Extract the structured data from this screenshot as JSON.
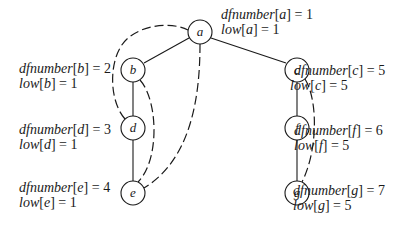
{
  "diagram": {
    "type": "dfs-tree-with-back-edges",
    "nodes": [
      {
        "id": "a",
        "label": "a",
        "x": 200,
        "y": 32,
        "dfnumber": "1",
        "low": "1"
      },
      {
        "id": "b",
        "label": "b",
        "x": 133,
        "y": 70,
        "dfnumber": "2",
        "low": "1"
      },
      {
        "id": "c",
        "label": "c",
        "x": 297,
        "y": 70,
        "dfnumber": "5",
        "low": "5"
      },
      {
        "id": "d",
        "label": "d",
        "x": 133,
        "y": 128,
        "dfnumber": "3",
        "low": "1"
      },
      {
        "id": "e",
        "label": "e",
        "x": 133,
        "y": 193,
        "dfnumber": "4",
        "low": "1"
      },
      {
        "id": "f",
        "label": "f",
        "x": 297,
        "y": 128,
        "dfnumber": "6",
        "low": "5"
      },
      {
        "id": "g",
        "label": "g",
        "x": 297,
        "y": 193,
        "dfnumber": "7",
        "low": "5"
      }
    ],
    "tree_edges": [
      [
        "a",
        "b"
      ],
      [
        "a",
        "c"
      ],
      [
        "b",
        "d"
      ],
      [
        "d",
        "e"
      ],
      [
        "c",
        "f"
      ],
      [
        "f",
        "g"
      ]
    ],
    "back_edges": [
      [
        "d",
        "a"
      ],
      [
        "e",
        "b"
      ],
      [
        "e",
        "a"
      ],
      [
        "g",
        "c"
      ]
    ],
    "annotation_labels": {
      "dfnumber": "dfnumber",
      "low": "low"
    },
    "annotations": {
      "a": {
        "df_line": [
          "dfnumber",
          "a",
          "1"
        ],
        "low_line": [
          "low",
          "a",
          "1"
        ]
      },
      "b": {
        "df_line": [
          "dfnumber",
          "b",
          "2"
        ],
        "low_line": [
          "low",
          "b",
          "1"
        ]
      },
      "c": {
        "df_line": [
          "dfnumber",
          "c",
          "5"
        ],
        "low_line": [
          "low",
          "c",
          "5"
        ]
      },
      "d": {
        "df_line": [
          "dfnumber",
          "d",
          "3"
        ],
        "low_line": [
          "low",
          "d",
          "1"
        ]
      },
      "e": {
        "df_line": [
          "dfnumber",
          "e",
          "4"
        ],
        "low_line": [
          "low",
          "e",
          "1"
        ]
      },
      "f": {
        "df_line": [
          "dfnumber",
          "f",
          "6"
        ],
        "low_line": [
          "low",
          "f",
          "5"
        ]
      },
      "g": {
        "df_line": [
          "dfnumber",
          "g",
          "7"
        ],
        "low_line": [
          "low",
          "g",
          "5"
        ]
      }
    }
  }
}
